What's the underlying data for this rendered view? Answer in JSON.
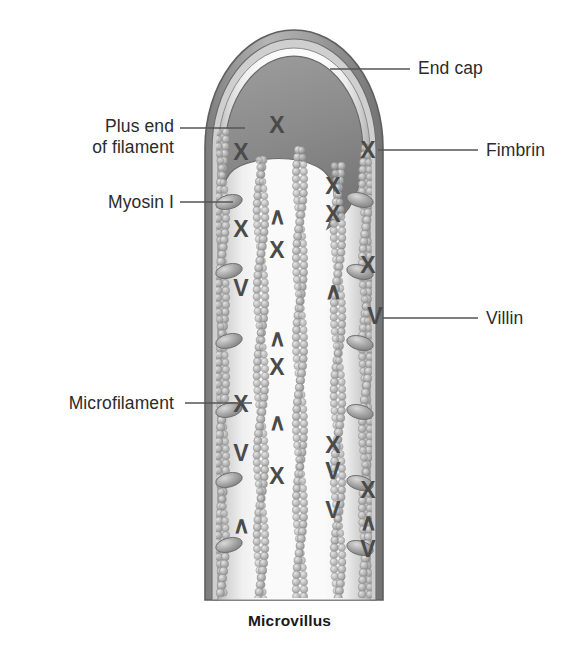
{
  "figure": {
    "caption": "Microvillus",
    "labels": {
      "end_cap": "End cap",
      "plus_end": "Plus end\nof filament",
      "myosin": "Myosin I",
      "fimbrin": "Fimbrin",
      "villin": "Villin",
      "microfilament": "Microfilament"
    },
    "icon_names": {
      "end_cap": "end-cap-shape",
      "membrane": "plasma-membrane-outline",
      "filament": "actin-microfilament-bead-chain",
      "myosin": "myosin-i-oval",
      "fimbrin": "fimbrin-crosslink-x",
      "villin": "villin-crosslink-v"
    },
    "colors": {
      "text": "#2b2b2b",
      "membrane_dark": "#6f6f6f",
      "membrane_mid": "#9a9a9a",
      "lumen_light": "#f2f2f2",
      "end_cap": "#8c8c8c",
      "bead": "#a8a8a8",
      "crosslink": "#4a4a4a",
      "leader": "#555555"
    },
    "counts": {
      "filaments": 6,
      "myosin_left": 6,
      "myosin_right": 5
    }
  },
  "chart_data": {
    "type": "diagram",
    "title": "Microvillus",
    "components": [
      {
        "name": "End cap",
        "role": "caps the plus ends of actin filaments at the microvillus tip"
      },
      {
        "name": "Plus end of filament",
        "role": "barbed (plus) end of actin microfilament embedded in the end cap"
      },
      {
        "name": "Myosin I",
        "role": "lateral arms linking the filament bundle to the plasma membrane"
      },
      {
        "name": "Fimbrin",
        "role": "actin bundling protein drawn as an X cross-link"
      },
      {
        "name": "Villin",
        "role": "actin bundling protein drawn as a V cross-link"
      },
      {
        "name": "Microfilament",
        "role": "actin filament shown as a double helical bead chain"
      }
    ],
    "crosslinks": [
      {
        "type": "X",
        "protein": "Fimbrin",
        "x": 277,
        "y": 127
      },
      {
        "type": "X",
        "protein": "Fimbrin",
        "x": 241,
        "y": 154
      },
      {
        "type": "X",
        "protein": "Fimbrin",
        "x": 368,
        "y": 152
      },
      {
        "type": "X",
        "protein": "Fimbrin",
        "x": 333,
        "y": 188
      },
      {
        "type": "X",
        "protein": "Fimbrin",
        "x": 241,
        "y": 231
      },
      {
        "type": "V",
        "protein": "Villin",
        "x": 277,
        "y": 218
      },
      {
        "type": "X",
        "protein": "Fimbrin",
        "x": 333,
        "y": 216
      },
      {
        "type": "X",
        "protein": "Fimbrin",
        "x": 277,
        "y": 252
      },
      {
        "type": "V",
        "protein": "Villin",
        "x": 241,
        "y": 290
      },
      {
        "type": "X",
        "protein": "Fimbrin",
        "x": 368,
        "y": 267
      },
      {
        "type": "V",
        "protein": "Villin",
        "x": 333,
        "y": 293
      },
      {
        "type": "V",
        "protein": "Villin",
        "x": 375,
        "y": 318
      },
      {
        "type": "V",
        "protein": "Villin",
        "x": 277,
        "y": 340
      },
      {
        "type": "X",
        "protein": "Fimbrin",
        "x": 277,
        "y": 369
      },
      {
        "type": "X",
        "protein": "Fimbrin",
        "x": 241,
        "y": 406
      },
      {
        "type": "V",
        "protein": "Villin",
        "x": 277,
        "y": 424
      },
      {
        "type": "X",
        "protein": "Fimbrin",
        "x": 333,
        "y": 447
      },
      {
        "type": "V",
        "protein": "Villin",
        "x": 241,
        "y": 455
      },
      {
        "type": "V",
        "protein": "Villin",
        "x": 333,
        "y": 473
      },
      {
        "type": "X",
        "protein": "Fimbrin",
        "x": 277,
        "y": 478
      },
      {
        "type": "V",
        "protein": "Villin",
        "x": 333,
        "y": 512
      },
      {
        "type": "X",
        "protein": "Fimbrin",
        "x": 368,
        "y": 492
      },
      {
        "type": "V",
        "protein": "Villin",
        "x": 241,
        "y": 527
      },
      {
        "type": "V",
        "protein": "Villin",
        "x": 368,
        "y": 524
      },
      {
        "type": "V",
        "protein": "Villin",
        "x": 368,
        "y": 551
      }
    ],
    "leaders": [
      {
        "label": "End cap",
        "from": [
          410,
          69
        ],
        "to": [
          330,
          69
        ]
      },
      {
        "label": "Plus end of filament",
        "from": [
          180,
          128
        ],
        "to": [
          245,
          128
        ]
      },
      {
        "label": "Myosin I",
        "from": [
          180,
          202
        ],
        "to": [
          233,
          202
        ]
      },
      {
        "label": "Fimbrin",
        "from": [
          478,
          150
        ],
        "to": [
          378,
          150
        ]
      },
      {
        "label": "Villin",
        "from": [
          478,
          318
        ],
        "to": [
          383,
          318
        ]
      },
      {
        "label": "Microfilament",
        "from": [
          185,
          403
        ],
        "to": [
          252,
          403
        ]
      }
    ]
  }
}
